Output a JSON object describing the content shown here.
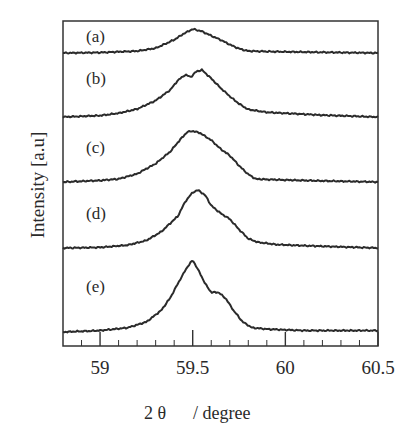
{
  "chart_data": {
    "type": "line",
    "title": "",
    "xlabel": "2θ   / degree",
    "xlabel_parts": [
      "2 θ",
      "/ degree"
    ],
    "ylabel": "Intensity [a.u]",
    "xlim": [
      58.8,
      60.5
    ],
    "x_ticks_major": [
      59,
      59.5,
      60,
      60.5
    ],
    "x_tick_labels": [
      "59",
      "59.5",
      "60",
      "60.5"
    ],
    "x_tick_minor_step": 0.1,
    "grid": false,
    "legend": "none (panel labels)",
    "stacked_offset": true,
    "y_ticks": false,
    "series": [
      {
        "name": "(a)",
        "baseline_px": 53,
        "peak_height_px": 24,
        "points": [
          [
            58.8,
            0
          ],
          [
            59.0,
            0.02
          ],
          [
            59.2,
            0.08
          ],
          [
            59.3,
            0.2
          ],
          [
            59.4,
            0.55
          ],
          [
            59.45,
            0.8
          ],
          [
            59.5,
            1.0
          ],
          [
            59.55,
            0.9
          ],
          [
            59.6,
            0.72
          ],
          [
            59.65,
            0.55
          ],
          [
            59.7,
            0.35
          ],
          [
            59.75,
            0.18
          ],
          [
            59.8,
            0.08
          ],
          [
            60.0,
            0.05
          ],
          [
            60.2,
            0.03
          ],
          [
            60.5,
            0.0
          ]
        ]
      },
      {
        "name": "(b)",
        "baseline_px": 117,
        "peak_height_px": 47,
        "points": [
          [
            58.8,
            0
          ],
          [
            59.0,
            0.03
          ],
          [
            59.1,
            0.08
          ],
          [
            59.2,
            0.17
          ],
          [
            59.3,
            0.35
          ],
          [
            59.38,
            0.58
          ],
          [
            59.42,
            0.78
          ],
          [
            59.46,
            0.9
          ],
          [
            59.49,
            0.85
          ],
          [
            59.52,
            0.97
          ],
          [
            59.55,
            1.0
          ],
          [
            59.6,
            0.82
          ],
          [
            59.65,
            0.62
          ],
          [
            59.7,
            0.44
          ],
          [
            59.75,
            0.28
          ],
          [
            59.8,
            0.16
          ],
          [
            59.9,
            0.1
          ],
          [
            60.0,
            0.08
          ],
          [
            60.2,
            0.04
          ],
          [
            60.5,
            0.0
          ]
        ]
      },
      {
        "name": "(c)",
        "baseline_px": 182,
        "peak_height_px": 51,
        "points": [
          [
            58.8,
            0
          ],
          [
            59.0,
            0.03
          ],
          [
            59.1,
            0.06
          ],
          [
            59.2,
            0.16
          ],
          [
            59.3,
            0.36
          ],
          [
            59.38,
            0.6
          ],
          [
            59.43,
            0.82
          ],
          [
            59.47,
            0.98
          ],
          [
            59.5,
            1.0
          ],
          [
            59.54,
            0.96
          ],
          [
            59.6,
            0.82
          ],
          [
            59.65,
            0.65
          ],
          [
            59.7,
            0.52
          ],
          [
            59.75,
            0.32
          ],
          [
            59.8,
            0.15
          ],
          [
            59.84,
            0.06
          ],
          [
            59.9,
            0.05
          ],
          [
            60.1,
            0.03
          ],
          [
            60.5,
            0.0
          ]
        ]
      },
      {
        "name": "(d)",
        "baseline_px": 248,
        "peak_height_px": 58,
        "points": [
          [
            58.8,
            0
          ],
          [
            59.0,
            0.01
          ],
          [
            59.15,
            0.05
          ],
          [
            59.25,
            0.13
          ],
          [
            59.33,
            0.28
          ],
          [
            59.37,
            0.4
          ],
          [
            59.42,
            0.55
          ],
          [
            59.46,
            0.8
          ],
          [
            59.5,
            0.96
          ],
          [
            59.53,
            1.0
          ],
          [
            59.57,
            0.9
          ],
          [
            59.6,
            0.73
          ],
          [
            59.65,
            0.6
          ],
          [
            59.7,
            0.5
          ],
          [
            59.75,
            0.32
          ],
          [
            59.8,
            0.16
          ],
          [
            59.85,
            0.1
          ],
          [
            59.95,
            0.06
          ],
          [
            60.1,
            0.04
          ],
          [
            60.5,
            0.0
          ]
        ]
      },
      {
        "name": "(e)",
        "baseline_px": 332,
        "peak_height_px": 72,
        "points": [
          [
            58.8,
            0
          ],
          [
            59.0,
            0.02
          ],
          [
            59.15,
            0.06
          ],
          [
            59.25,
            0.14
          ],
          [
            59.33,
            0.3
          ],
          [
            59.38,
            0.48
          ],
          [
            59.43,
            0.72
          ],
          [
            59.47,
            0.9
          ],
          [
            59.5,
            1.0
          ],
          [
            59.53,
            0.86
          ],
          [
            59.57,
            0.66
          ],
          [
            59.6,
            0.55
          ],
          [
            59.64,
            0.55
          ],
          [
            59.68,
            0.46
          ],
          [
            59.72,
            0.3
          ],
          [
            59.77,
            0.14
          ],
          [
            59.82,
            0.06
          ],
          [
            59.9,
            0.04
          ],
          [
            60.1,
            0.02
          ],
          [
            60.5,
            0.02
          ]
        ]
      }
    ]
  }
}
